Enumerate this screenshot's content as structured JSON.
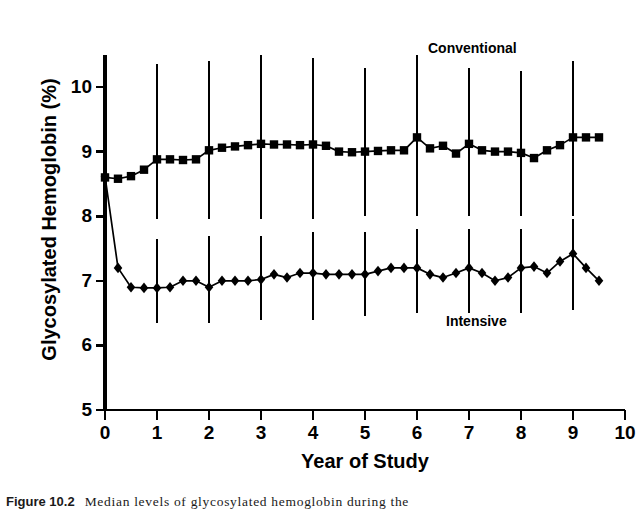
{
  "figure": {
    "caption_label": "Figure 10.2",
    "caption_text": "Median levels of glycosylated hemoglobin during the"
  },
  "axes": {
    "ylabel": "Glycosylated Hemoglobin (%)",
    "xlabel": "Year of Study",
    "ytick_labels": [
      "5",
      "6",
      "7",
      "8",
      "9",
      "10"
    ],
    "xtick_labels": [
      "0",
      "1",
      "2",
      "3",
      "4",
      "5",
      "6",
      "7",
      "8",
      "9",
      "10"
    ]
  },
  "annotations": {
    "conventional": "Conventional",
    "intensive": "Intensive"
  },
  "colors": {
    "ink": "#000000",
    "background": "#ffffff"
  },
  "chart_data": {
    "type": "line",
    "title": "",
    "subtitle": "",
    "xlabel": "Year of Study",
    "ylabel": "Glycosylated Hemoglobin (%)",
    "xlim": [
      0,
      10
    ],
    "ylim": [
      5,
      10.5
    ],
    "xticks": [
      0,
      1,
      2,
      3,
      4,
      5,
      6,
      7,
      8,
      9,
      10
    ],
    "yticks": [
      5,
      6,
      7,
      8,
      9,
      10
    ],
    "grid": false,
    "legend_position": "inline-annotation",
    "marker_styles": {
      "Conventional": "square",
      "Intensive": "diamond"
    },
    "error_bar_note": "Vertical bars show interquartile range at each whole year",
    "series": [
      {
        "name": "Conventional",
        "marker": "square",
        "x": [
          0,
          0.25,
          0.5,
          0.75,
          1.0,
          1.25,
          1.5,
          1.75,
          2.0,
          2.25,
          2.5,
          2.75,
          3.0,
          3.25,
          3.5,
          3.75,
          4.0,
          4.25,
          4.5,
          4.75,
          5.0,
          5.25,
          5.5,
          5.75,
          6.0,
          6.25,
          6.5,
          6.75,
          7.0,
          7.25,
          7.5,
          7.75,
          8.0,
          8.25,
          8.5,
          8.75,
          9.0,
          9.25,
          9.5
        ],
        "values": [
          8.6,
          8.58,
          8.62,
          8.72,
          8.88,
          8.88,
          8.87,
          8.88,
          9.02,
          9.06,
          9.08,
          9.1,
          9.12,
          9.11,
          9.11,
          9.1,
          9.11,
          9.09,
          9.0,
          8.99,
          9.0,
          9.01,
          9.02,
          9.02,
          9.22,
          9.05,
          9.09,
          8.97,
          9.12,
          9.02,
          9.0,
          9.0,
          8.98,
          8.9,
          9.02,
          9.1,
          9.22,
          9.22,
          9.22
        ],
        "error_bars": [
          {
            "x": 1,
            "low": 7.95,
            "high": 10.35
          },
          {
            "x": 2,
            "low": 7.95,
            "high": 10.4
          },
          {
            "x": 3,
            "low": 7.95,
            "high": 10.5
          },
          {
            "x": 4,
            "low": 7.95,
            "high": 10.45
          },
          {
            "x": 5,
            "low": 8.0,
            "high": 10.3
          },
          {
            "x": 6,
            "low": 8.0,
            "high": 10.5
          },
          {
            "x": 7,
            "low": 8.0,
            "high": 10.3
          },
          {
            "x": 8,
            "low": 8.0,
            "high": 10.25
          },
          {
            "x": 9,
            "low": 8.0,
            "high": 10.4
          }
        ]
      },
      {
        "name": "Intensive",
        "marker": "diamond",
        "x": [
          0,
          0.25,
          0.5,
          0.75,
          1.0,
          1.25,
          1.5,
          1.75,
          2.0,
          2.25,
          2.5,
          2.75,
          3.0,
          3.25,
          3.5,
          3.75,
          4.0,
          4.25,
          4.5,
          4.75,
          5.0,
          5.25,
          5.5,
          5.75,
          6.0,
          6.25,
          6.5,
          6.75,
          7.0,
          7.25,
          7.5,
          7.75,
          8.0,
          8.25,
          8.5,
          8.75,
          9.0,
          9.25,
          9.5
        ],
        "values": [
          8.62,
          7.2,
          6.9,
          6.89,
          6.89,
          6.9,
          7.0,
          7.0,
          6.9,
          7.0,
          7.0,
          7.0,
          7.02,
          7.1,
          7.05,
          7.12,
          7.12,
          7.1,
          7.1,
          7.1,
          7.1,
          7.15,
          7.2,
          7.2,
          7.2,
          7.1,
          7.05,
          7.12,
          7.2,
          7.12,
          7.0,
          7.05,
          7.2,
          7.22,
          7.12,
          7.3,
          7.42,
          7.2,
          7.0
        ],
        "error_bars": [
          {
            "x": 1,
            "low": 6.35,
            "high": 7.65
          },
          {
            "x": 2,
            "low": 6.35,
            "high": 7.7
          },
          {
            "x": 3,
            "low": 6.4,
            "high": 7.7
          },
          {
            "x": 4,
            "low": 6.4,
            "high": 7.75
          },
          {
            "x": 5,
            "low": 6.45,
            "high": 7.75
          },
          {
            "x": 6,
            "low": 6.5,
            "high": 7.8
          },
          {
            "x": 7,
            "low": 6.5,
            "high": 7.8
          },
          {
            "x": 8,
            "low": 6.5,
            "high": 7.8
          },
          {
            "x": 9,
            "low": 6.55,
            "high": 7.95
          }
        ]
      }
    ]
  }
}
